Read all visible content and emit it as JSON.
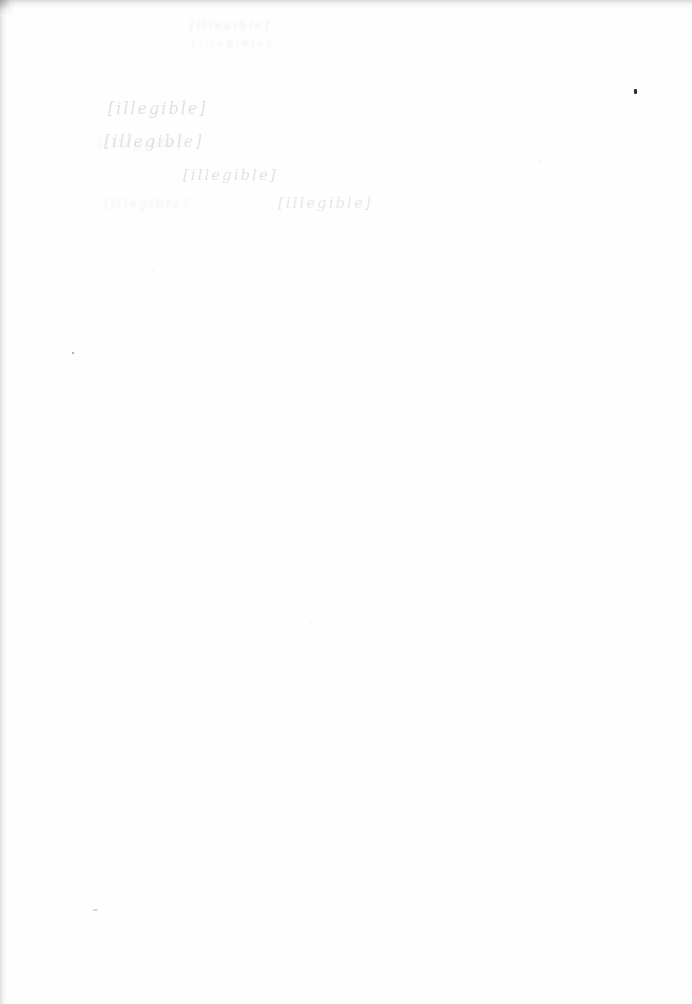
{
  "document": {
    "kind": "scanned-page",
    "orientation": "portrait",
    "width_px": 692,
    "height_px": 1004,
    "background_color": "#fefefe",
    "condition": "near-blank page; ink extremely faded / washed out, text not legible",
    "legible_text_present": false
  },
  "header_block": {
    "line_1": "[illegible]",
    "line_2": "[illegible]"
  },
  "body_block": {
    "lines": [
      {
        "text": "[illegible]"
      },
      {
        "text": "[illegible]"
      },
      {
        "text": "[illegible]"
      },
      {
        "text": "[illegible]"
      }
    ],
    "stray_marks": [
      {
        "text": "[illegible]"
      },
      {
        "text": "[illegible]"
      }
    ]
  },
  "artifacts": {
    "ink_speck_main": {
      "color": "#2b2b30"
    },
    "ink_speck_secondary": {
      "color": "#46464e"
    },
    "ink_speck_faint": {
      "color": "#96969e"
    },
    "scan_shadow_color": "#a6a6aa"
  }
}
